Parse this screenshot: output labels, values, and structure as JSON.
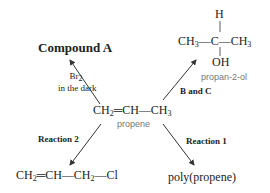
{
  "center": {
    "formula": [
      "CH",
      "2",
      "═CH—CH",
      "3"
    ],
    "label": "propene"
  },
  "top_left": {
    "product": "Compound A",
    "reagent_line1": "Br",
    "reagent_line1_sub": "2",
    "reagent_line2": "in the dark"
  },
  "top_right": {
    "h": "H",
    "left": "CH",
    "left_sub": "3",
    "center": "C",
    "right": "CH",
    "right_sub": "3",
    "oh": "OH",
    "label": "propan-2-ol",
    "reagent": "B and C"
  },
  "bottom_left": {
    "reaction": "Reaction 2",
    "product": [
      "CH",
      "2",
      "═CH—CH",
      "2",
      "—Cl"
    ]
  },
  "bottom_right": {
    "reaction": "Reaction 1",
    "product": "poly(propene)"
  },
  "colors": {
    "text": "#222222",
    "label_gray": "#777777",
    "arrow": "#333333"
  }
}
